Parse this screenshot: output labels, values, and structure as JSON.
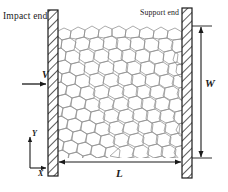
{
  "figure": {
    "labels": {
      "impact_end": "Impact end",
      "support_end": "Support end",
      "velocity": "V",
      "width": "W",
      "length": "L",
      "axis_y": "Y",
      "axis_x": "X"
    },
    "colors": {
      "line": "#1a1a1a",
      "cell_wall": "#9a9a9a",
      "plate_fill": "#ffffff",
      "background": "#ffffff"
    },
    "geometry": {
      "impact_plate": {
        "x": 48,
        "y": 10,
        "width": 10,
        "height": 166
      },
      "support_plate": {
        "x": 182,
        "y": 8,
        "width": 10,
        "height": 170
      },
      "foam_region": {
        "x": 58,
        "y": 25,
        "width": 124,
        "height": 133
      },
      "length_dimension": {
        "x1": 58,
        "x2": 182,
        "y": 162
      },
      "width_dimension": {
        "x": 200,
        "y1": 26,
        "y2": 158
      },
      "velocity_arrow": {
        "x1": 22,
        "x2": 47,
        "y": 84
      },
      "axes_origin": {
        "x": 30,
        "y": 168
      }
    }
  }
}
